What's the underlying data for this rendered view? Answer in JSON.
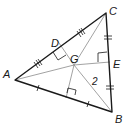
{
  "diagram": {
    "type": "triangle-geometry",
    "points": {
      "A": {
        "label": "A",
        "x": 15,
        "y": 80
      },
      "B": {
        "label": "B",
        "x": 112,
        "y": 112
      },
      "C": {
        "label": "C",
        "x": 106,
        "y": 13
      },
      "G": {
        "label": "G",
        "x": 74,
        "y": 65
      },
      "D": {
        "label": "D",
        "x": 57,
        "y": 40
      },
      "E": {
        "label": "E",
        "x": 110,
        "y": 62
      },
      "F": {
        "label": "",
        "x": 70,
        "y": 97
      }
    },
    "labels": {
      "A": "A",
      "B": "B",
      "C": "C",
      "D": "D",
      "E": "E",
      "G": "G",
      "segment_value": "2"
    },
    "colors": {
      "triangle_stroke": "#1a1a1a",
      "inner_stroke": "#8a8a8a",
      "text": "#1a1a1a"
    },
    "markings": {
      "AD_DC": "triple tick marks (congruent)",
      "CE_EB": "double tick marks (congruent)",
      "AF_FB": "single tick marks (congruent)",
      "right_angles": [
        "D",
        "E",
        "F"
      ]
    }
  }
}
